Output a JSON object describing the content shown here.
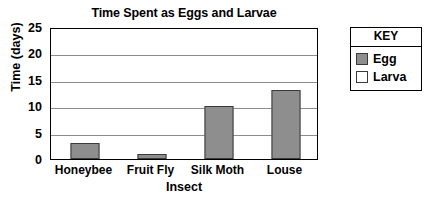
{
  "chart_data": {
    "type": "bar",
    "title": "Time Spent as Eggs and Larvae",
    "xlabel": "Insect",
    "ylabel": "Time (days)",
    "categories": [
      "Honeybee",
      "Fruit Fly",
      "Silk Moth",
      "Louse"
    ],
    "series": [
      {
        "name": "Egg",
        "color": "#8e8e8e",
        "values": [
          3,
          1,
          10,
          13
        ]
      }
    ],
    "legend_title": "KEY",
    "legend_entries": [
      {
        "label": "Egg",
        "color": "#8e8e8e"
      },
      {
        "label": "Larva",
        "color": "#ffffff"
      }
    ],
    "ylim": [
      0,
      25
    ],
    "yticks": [
      0,
      5,
      10,
      15,
      20,
      25
    ],
    "ytick_labels": [
      "0",
      "5",
      "10",
      "15",
      "20",
      "25"
    ],
    "grid": true,
    "legend_position": "right-outside"
  }
}
